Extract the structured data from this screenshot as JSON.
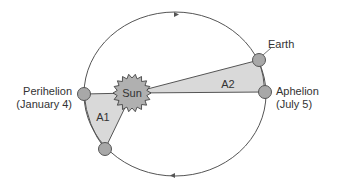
{
  "diagram": {
    "labels": {
      "sun": "Sun",
      "earth": "Earth",
      "perihelion": "Perihelion",
      "perihelion_date": "(January 4)",
      "aphelion": "Aphelion",
      "aphelion_date": "(July 5)",
      "area1": "A1",
      "area2": "A2"
    },
    "colors": {
      "orbit_line": "#555555",
      "planet_fill": "#a8a8a8",
      "sun_fill": "#b0b0b0",
      "area_fill": "#d9d9d9",
      "text": "#333333"
    },
    "orbit_direction_arrows": [
      "top",
      "bottom"
    ]
  }
}
